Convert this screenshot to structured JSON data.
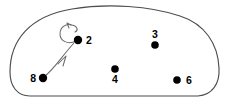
{
  "diagram": {
    "background_color": "#ffffff",
    "region": {
      "name": "enclosing-blob",
      "stroke_color": "#4d4d4d"
    },
    "nodes": [
      {
        "id": "2",
        "label": "2",
        "x": 78,
        "y": 40,
        "label_x": 86,
        "label_y": 44,
        "label_anchor": "start"
      },
      {
        "id": "3",
        "label": "3",
        "x": 155,
        "y": 45,
        "label_x": 155,
        "label_y": 38,
        "label_anchor": "middle"
      },
      {
        "id": "4",
        "label": "4",
        "x": 115,
        "y": 69,
        "label_x": 115,
        "label_y": 83,
        "label_anchor": "middle"
      },
      {
        "id": "6",
        "label": "6",
        "x": 177,
        "y": 80,
        "label_x": 186,
        "label_y": 84,
        "label_anchor": "start"
      },
      {
        "id": "8",
        "label": "8",
        "x": 43,
        "y": 78,
        "label_x": 36,
        "label_y": 82,
        "label_anchor": "end"
      }
    ],
    "edges": [
      {
        "name": "edge-8-to-2",
        "from": "8",
        "to": "2",
        "directed": true,
        "type": "arrow"
      },
      {
        "name": "self-loop-2",
        "from": "2",
        "to": "2",
        "directed": true,
        "type": "self-loop"
      }
    ],
    "colors": {
      "node_fill": "#000000",
      "edge_stroke": "#6b6b6b",
      "region_stroke": "#4d4d4d",
      "label_color": "#000000"
    }
  }
}
